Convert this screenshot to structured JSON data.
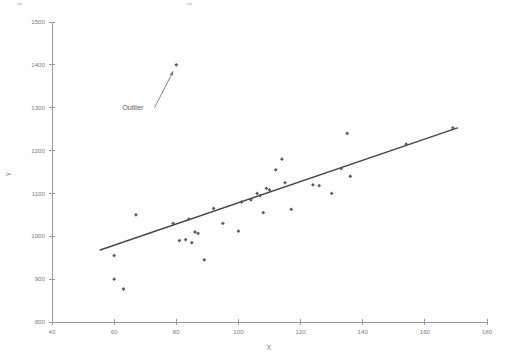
{
  "figure": {
    "background_color": "#ffffff",
    "point_color": "#5a5a66",
    "line_color": "#44444e",
    "axis_color": "#9a9a9a",
    "tick_label_color": "#7d7d7d",
    "top_fragment_left": "▄",
    "top_fragment_right": "▄"
  },
  "chart_data": {
    "type": "scatter",
    "title": "",
    "xlabel": "X",
    "ylabel": "Y",
    "xlim": [
      40,
      180
    ],
    "ylim": [
      800,
      1500
    ],
    "xticks": [
      40,
      60,
      80,
      100,
      120,
      140,
      160,
      180
    ],
    "yticks": [
      800,
      900,
      1000,
      1100,
      1200,
      1300,
      1400,
      1500
    ],
    "xtick_labels": [
      "40",
      "60",
      "80",
      "100",
      "120",
      "140",
      "160",
      "180"
    ],
    "ytick_labels": [
      "800",
      "900",
      "1000",
      "1100",
      "1200",
      "1300",
      "1400",
      "1500"
    ],
    "grid": false,
    "legend": null,
    "series": [
      {
        "name": "observations",
        "marker": "diamond",
        "color": "#5a5a66",
        "points": [
          [
            60,
            955
          ],
          [
            60,
            900
          ],
          [
            63,
            877
          ],
          [
            67,
            1050
          ],
          [
            79,
            1030
          ],
          [
            80,
            1400
          ],
          [
            81,
            990
          ],
          [
            83,
            992
          ],
          [
            84,
            1040
          ],
          [
            85,
            985
          ],
          [
            86,
            1010
          ],
          [
            87,
            1007
          ],
          [
            89,
            945
          ],
          [
            92,
            1065
          ],
          [
            95,
            1030
          ],
          [
            100,
            1012
          ],
          [
            101,
            1080
          ],
          [
            104,
            1085
          ],
          [
            106,
            1100
          ],
          [
            107,
            1095
          ],
          [
            108,
            1055
          ],
          [
            109,
            1112
          ],
          [
            110,
            1108
          ],
          [
            112,
            1155
          ],
          [
            114,
            1180
          ],
          [
            115,
            1125
          ],
          [
            117,
            1063
          ],
          [
            124,
            1120
          ],
          [
            126,
            1118
          ],
          [
            130,
            1100
          ],
          [
            133,
            1158
          ],
          [
            135,
            1240
          ],
          [
            136,
            1140
          ],
          [
            154,
            1215
          ],
          [
            169,
            1253
          ]
        ]
      }
    ],
    "trend_line": {
      "name": "regression-line",
      "color": "#44444e",
      "x_start": 55.5,
      "y_start": 968,
      "x_end": 170.5,
      "y_end": 1253
    },
    "annotations": [
      {
        "name": "outlier-annotation",
        "label": "Outlier",
        "label_x": 66,
        "label_y": 1295,
        "arrow_from_x": 73,
        "arrow_from_y": 1300,
        "arrow_to_x": 79,
        "arrow_to_y": 1385
      }
    ]
  }
}
